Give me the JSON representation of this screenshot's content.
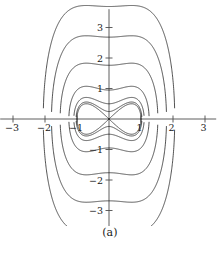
{
  "figure": {
    "caption": "(a)",
    "background_color": "#ffffff",
    "curve_color": "#1a1a1a",
    "axis_color": "#4d4d4d"
  },
  "chart_data": {
    "type": "line",
    "title": "",
    "subtitle": "",
    "xlabel": "",
    "ylabel": "",
    "xlim": [
      -3.45,
      3.45
    ],
    "ylim": [
      -3.6,
      3.6
    ],
    "grid": false,
    "legend": "none",
    "function": "y^2 - x^2 + x^4",
    "saddle_points": [
      [
        -1,
        0
      ],
      [
        1,
        0
      ]
    ],
    "center_points": [
      [
        0,
        0
      ]
    ],
    "levels": [
      -0.22,
      -0.1,
      0,
      0.9,
      3.1,
      7.2,
      13.6
    ],
    "x_ticks": [
      -3,
      -2,
      -1,
      1,
      2,
      3
    ],
    "y_ticks": [
      -3,
      -2,
      -1,
      1,
      2,
      3
    ],
    "x_tick_labels": [
      "−3",
      "−2",
      "−1",
      "1",
      "2",
      "3"
    ],
    "y_tick_labels": [
      "−3",
      "−2",
      "−1",
      "1",
      "2",
      "3"
    ],
    "series": [
      {
        "name": "level -0.22 inner oval",
        "level": -0.22,
        "closed": true,
        "y_at_x0": 0.48
      },
      {
        "name": "level -0.10 middle oval",
        "level": -0.1,
        "closed": true,
        "y_at_x0": 0.72
      },
      {
        "name": "level 0 separatrix",
        "level": 0,
        "closed": false,
        "y_at_x0": 0.0
      },
      {
        "name": "level 0.9 contour",
        "level": 0.9,
        "closed": false,
        "y_at_x0": 0.95
      },
      {
        "name": "level 3.1 contour",
        "level": 3.1,
        "closed": false,
        "y_at_x0": 1.95
      },
      {
        "name": "level 7.2 contour",
        "level": 7.2,
        "closed": false,
        "y_at_x0": 3.0
      },
      {
        "name": "level -0.22 lower oval mirror",
        "level": -0.22,
        "closed": true,
        "y_at_x0": -0.48
      },
      {
        "name": "level 0.9 lower contour",
        "level": 0.9,
        "closed": false,
        "y_at_x0": -0.95
      },
      {
        "name": "level 3.1 lower contour",
        "level": 3.1,
        "closed": false,
        "y_at_x0": -1.95
      },
      {
        "name": "level 7.2 lower contour",
        "level": 7.2,
        "closed": false,
        "y_at_x0": -3.0
      }
    ]
  },
  "geometry": {
    "origin_x": 109,
    "origin_y": 119,
    "unit_x": 32.0,
    "unit_y": 30.5,
    "x_axis_start": -3.4,
    "x_axis_end": 3.35,
    "y_axis_top": 3.6,
    "y_axis_bottom": -3.55,
    "tick_len": 3.5
  }
}
